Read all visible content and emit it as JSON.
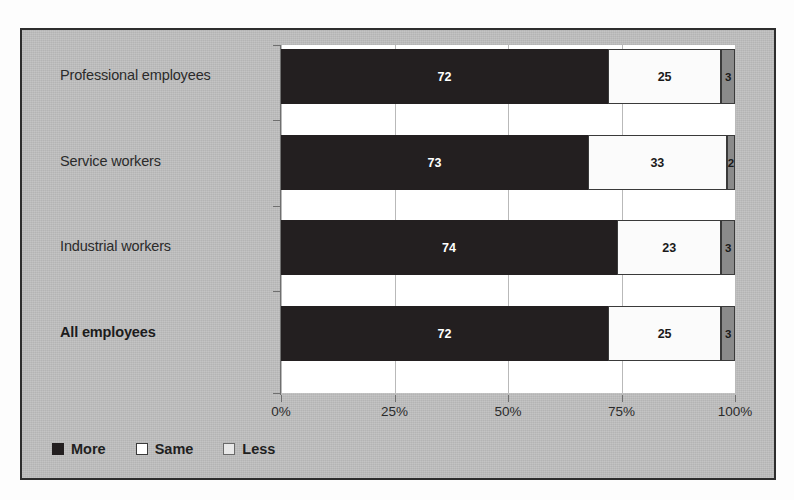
{
  "chart_data": {
    "type": "bar",
    "subtype": "stacked-horizontal-100",
    "title": "",
    "xlabel": "",
    "ylabel": "",
    "xlim": [
      0,
      100
    ],
    "grid": true,
    "legend_position": "bottom-left",
    "xtick_labels": [
      "0%",
      "25%",
      "50%",
      "75%",
      "100%"
    ],
    "xticks": [
      0,
      25,
      50,
      75,
      100
    ],
    "categories": [
      "Professional employees",
      "Service workers",
      "Industrial workers",
      "All employees"
    ],
    "series": [
      {
        "name": "More",
        "values": [
          72,
          73,
          74,
          72
        ]
      },
      {
        "name": "Same",
        "values": [
          25,
          33,
          23,
          25
        ]
      },
      {
        "name": "Less",
        "values": [
          3,
          2,
          3,
          3
        ]
      }
    ],
    "rows": [
      {
        "category": "Professional employees",
        "bold": false,
        "segments": [
          {
            "series": "More",
            "value": 72,
            "label": "72",
            "width_pct": 72.0
          },
          {
            "series": "Same",
            "value": 25,
            "label": "25",
            "width_pct": 25.0
          },
          {
            "series": "Less",
            "value": 3,
            "label": "3",
            "width_pct": 3.0
          }
        ]
      },
      {
        "category": "Service workers",
        "bold": false,
        "segments": [
          {
            "series": "More",
            "value": 73,
            "label": "73",
            "width_pct": 67.6
          },
          {
            "series": "Same",
            "value": 33,
            "label": "33",
            "width_pct": 30.6
          },
          {
            "series": "Less",
            "value": 2,
            "label": "2",
            "width_pct": 1.8
          }
        ]
      },
      {
        "category": "Industrial workers",
        "bold": false,
        "segments": [
          {
            "series": "More",
            "value": 74,
            "label": "74",
            "width_pct": 74.0
          },
          {
            "series": "Same",
            "value": 23,
            "label": "23",
            "width_pct": 23.0
          },
          {
            "series": "Less",
            "value": 3,
            "label": "3",
            "width_pct": 3.0
          }
        ]
      },
      {
        "category": "All employees",
        "bold": true,
        "segments": [
          {
            "series": "More",
            "value": 72,
            "label": "72",
            "width_pct": 72.0
          },
          {
            "series": "Same",
            "value": 25,
            "label": "25",
            "width_pct": 25.0
          },
          {
            "series": "Less",
            "value": 3,
            "label": "3",
            "width_pct": 3.0
          }
        ]
      }
    ],
    "legend": [
      {
        "label": "More",
        "color": "#231f20"
      },
      {
        "label": "Same",
        "color": "#ffffff"
      },
      {
        "label": "Less",
        "color": "#8a8a8a"
      }
    ],
    "colors": {
      "more": "#231f20",
      "same": "#ffffff",
      "less": "#8a8a8a",
      "plot_background": "#ffffff",
      "chart_background": "#bfbfbf",
      "frame_border": "#2e2e2e",
      "gridline": "#b9b9b9",
      "text": "#2b2b2b"
    }
  }
}
